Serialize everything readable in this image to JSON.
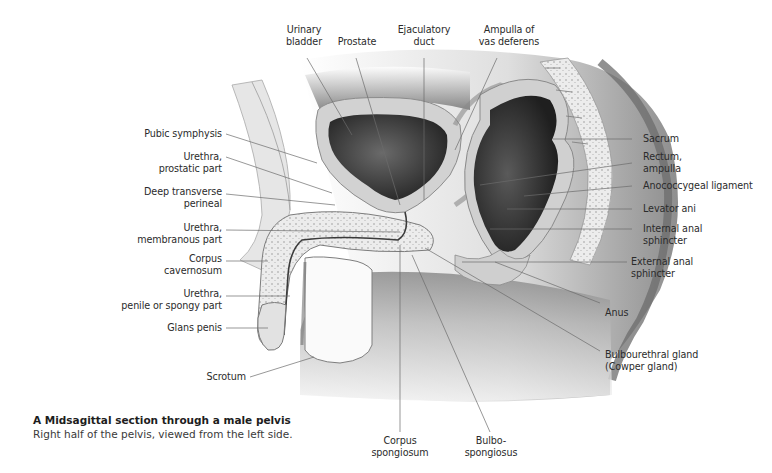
{
  "figure": {
    "caption_title": "A  Midsagittal section through a male pelvis",
    "caption_subtitle": "Right half of the pelvis, viewed from the left side.",
    "labels": {
      "top": [
        {
          "id": "urinary-bladder",
          "line1": "Urinary",
          "line2": "bladder"
        },
        {
          "id": "prostate",
          "line1": "Prostate",
          "line2": ""
        },
        {
          "id": "ejaculatory-duct",
          "line1": "Ejaculatory",
          "line2": "duct"
        },
        {
          "id": "ampulla-vas-deferens",
          "line1": "Ampulla of",
          "line2": "vas deferens"
        }
      ],
      "left": [
        {
          "id": "pubic-symphysis",
          "line1": "Pubic symphysis",
          "line2": ""
        },
        {
          "id": "urethra-prostatic",
          "line1": "Urethra,",
          "line2": "prostatic part"
        },
        {
          "id": "deep-transverse-perineal",
          "line1": "Deep transverse",
          "line2": "perineal"
        },
        {
          "id": "urethra-membranous",
          "line1": "Urethra,",
          "line2": "membranous part"
        },
        {
          "id": "corpus-cavernosum",
          "line1": "Corpus",
          "line2": "cavernosum"
        },
        {
          "id": "urethra-penile",
          "line1": "Urethra,",
          "line2": "penile or spongy part"
        },
        {
          "id": "glans-penis",
          "line1": "Glans penis",
          "line2": ""
        },
        {
          "id": "scrotum",
          "line1": "Scrotum",
          "line2": ""
        }
      ],
      "right": [
        {
          "id": "sacrum",
          "line1": "Sacrum",
          "line2": ""
        },
        {
          "id": "rectum-ampulla",
          "line1": "Rectum,",
          "line2": "ampulla"
        },
        {
          "id": "anococcygeal-ligament",
          "line1": "Anococcygeal ligament",
          "line2": ""
        },
        {
          "id": "levator-ani",
          "line1": "Levator ani",
          "line2": ""
        },
        {
          "id": "internal-anal-sphincter",
          "line1": "Internal anal",
          "line2": "sphincter"
        },
        {
          "id": "external-anal-sphincter",
          "line1": "External anal",
          "line2": "sphincter"
        },
        {
          "id": "anus",
          "line1": "Anus",
          "line2": ""
        },
        {
          "id": "bulbourethral-gland",
          "line1": "Bulbourethral gland",
          "line2": "(Cowper gland)"
        }
      ],
      "bottom": [
        {
          "id": "corpus-spongiosum",
          "line1": "Corpus",
          "line2": "spongiosum"
        },
        {
          "id": "bulbospongiosus",
          "line1": "Bulbo-",
          "line2": "spongiosus"
        }
      ]
    },
    "colors": {
      "leader_line": "#6b6b6b",
      "tissue_light": "#e9e9e9",
      "tissue_mid": "#bdbdbd",
      "tissue_dark": "#3c3c3c",
      "skin_shadow": "#8a8a8a"
    }
  }
}
